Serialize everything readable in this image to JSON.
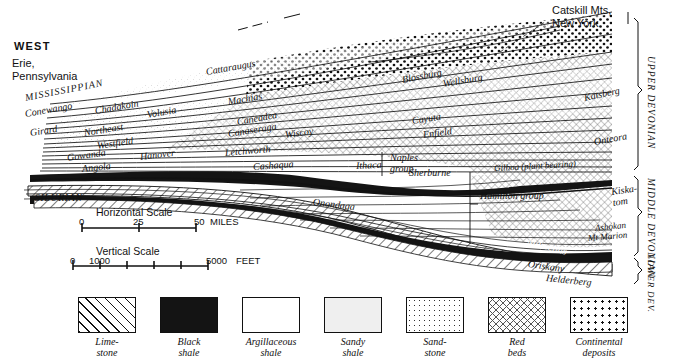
{
  "figure": {
    "type": "geologic-cross-section",
    "orientation_labels": {
      "west": "WEST",
      "west_place": "Erie,\nPennsylvania",
      "east_place": "Catskill Mts,\nNew York"
    }
  },
  "systems": {
    "mississippian": "MISSISSIPPIAN",
    "silurian": "SILURIAN"
  },
  "brackets": [
    {
      "id": "upper-devonian",
      "label": "UPPER DEVONIAN"
    },
    {
      "id": "middle-devonian",
      "label": "MIDDLE DEVONIAN"
    },
    {
      "id": "lower-devonian",
      "label": "LOWER DEV."
    }
  ],
  "formations": [
    {
      "id": "cattaraugus",
      "label": "Cattaraugus"
    },
    {
      "id": "conewango",
      "label": "Conewango"
    },
    {
      "id": "chadakoin",
      "label": "Chadakoin"
    },
    {
      "id": "volusia",
      "label": "Volusia"
    },
    {
      "id": "machias",
      "label": "Machias"
    },
    {
      "id": "girard",
      "label": "Girard"
    },
    {
      "id": "northeast",
      "label": "Northeast"
    },
    {
      "id": "caneadea",
      "label": "Caneadea"
    },
    {
      "id": "canaseraga",
      "label": "Canaseraga"
    },
    {
      "id": "wiscoy",
      "label": "Wiscoy"
    },
    {
      "id": "westfield",
      "label": "Westfield"
    },
    {
      "id": "gowanda",
      "label": "Gowanda"
    },
    {
      "id": "hanover",
      "label": "Hanover"
    },
    {
      "id": "letchworth",
      "label": "Letchworth"
    },
    {
      "id": "naples-group",
      "label": "Naples\ngroup"
    },
    {
      "id": "angola",
      "label": "Angola"
    },
    {
      "id": "cashaqua",
      "label": "Cashaqua"
    },
    {
      "id": "ithaca",
      "label": "Ithaca"
    },
    {
      "id": "sherburne",
      "label": "Sherburne"
    },
    {
      "id": "blossburg",
      "label": "Blossburg"
    },
    {
      "id": "wellsburg",
      "label": "Wellsburg"
    },
    {
      "id": "cayuta",
      "label": "Cayuta"
    },
    {
      "id": "enfield",
      "label": "Enfield"
    },
    {
      "id": "katsberg",
      "label": "Katsberg"
    },
    {
      "id": "onteora",
      "label": "Onteora"
    },
    {
      "id": "gilboa",
      "label": "Gilboa (plant bearing)"
    },
    {
      "id": "onondaga",
      "label": "Onondaga"
    },
    {
      "id": "hamilton-group",
      "label": "Hamilton group"
    },
    {
      "id": "kiskatom",
      "label": "Kiska-\ntom"
    },
    {
      "id": "ashokan",
      "label": "Ashokan"
    },
    {
      "id": "mt-marion",
      "label": "Mt Marion"
    },
    {
      "id": "marcellus",
      "label": "Marcellus"
    },
    {
      "id": "oriskany",
      "label": "Oriskany"
    },
    {
      "id": "helderberg",
      "label": "Helderberg"
    }
  ],
  "scales": {
    "horizontal": {
      "title": "Horizontal  Scale",
      "ticks": [
        "0",
        "25",
        "50"
      ],
      "unit": "MILES"
    },
    "vertical": {
      "title": "Vertical  Scale",
      "ticks": [
        "0",
        "1000",
        "5000"
      ],
      "unit": "FEET"
    }
  },
  "legend": [
    {
      "id": "limestone",
      "label": "Lime-\nstone",
      "pattern": "diagonal-hatch"
    },
    {
      "id": "black-shale",
      "label": "Black\nshale",
      "pattern": "solid-black"
    },
    {
      "id": "argillaceous-shale",
      "label": "Argillaceous\nshale",
      "pattern": "blank"
    },
    {
      "id": "sandy-shale",
      "label": "Sandy\nshale",
      "pattern": "stipple-light"
    },
    {
      "id": "sandstone",
      "label": "Sand-\nstone",
      "pattern": "fine-dots"
    },
    {
      "id": "red-beds",
      "label": "Red\nbeds",
      "pattern": "cross-hatch"
    },
    {
      "id": "continental-deposits",
      "label": "Continental\ndeposits",
      "pattern": "coarse-dots"
    }
  ],
  "colors": {
    "ink": "#111111",
    "paper": "#ffffff",
    "black_shale": "#141414"
  }
}
